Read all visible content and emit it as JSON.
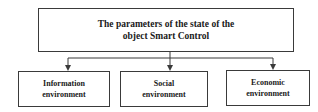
{
  "diagram": {
    "type": "hierarchy",
    "root": {
      "label_line1": "The parameters of the state of the",
      "label_line2": "object Smart Control"
    },
    "children": [
      {
        "line1": "Information",
        "line2": "environment"
      },
      {
        "line1": "Social",
        "line2": "environment"
      },
      {
        "line1": "Economic",
        "line2": "environment"
      }
    ],
    "edges": [
      {
        "from": "root",
        "to": "children.0"
      },
      {
        "from": "root",
        "to": "children.1"
      },
      {
        "from": "root",
        "to": "children.2"
      }
    ],
    "colors": {
      "line": "#3a3a3a",
      "text": "#1a1a1a",
      "background": "#ffffff"
    }
  }
}
